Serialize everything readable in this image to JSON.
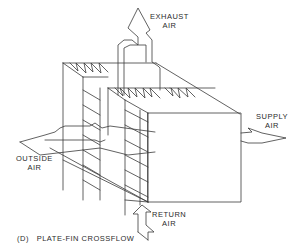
{
  "figure": {
    "caption_prefix": "(D)",
    "caption_title": "PLATE-FIN CROSSFLOW",
    "labels": {
      "exhaust_line1": "EXHAUST",
      "exhaust_line2": "AIR",
      "supply_line1": "SUPPLY",
      "supply_line2": "AIR",
      "outside_line1": "OUTSIDE",
      "outside_line2": "AIR",
      "return_line1": "RETURN",
      "return_line2": "AIR"
    },
    "colors": {
      "line": "#3a3a3a",
      "background": "#ffffff"
    }
  }
}
